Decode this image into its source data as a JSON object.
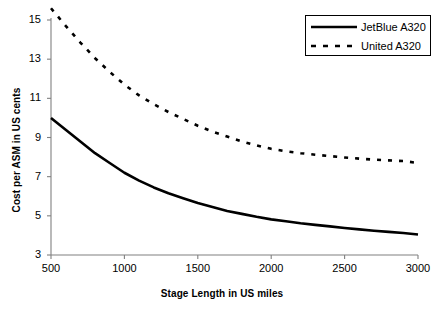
{
  "chart_data": {
    "type": "line",
    "title": "",
    "xlabel": "Stage Length in US miles",
    "ylabel": "Cost per ASM in US cents",
    "xlim": [
      500,
      3000
    ],
    "ylim": [
      3,
      15
    ],
    "xticks": [
      "500",
      "1000",
      "1500",
      "2000",
      "2500",
      "3000"
    ],
    "xtick_values": [
      500,
      1000,
      1500,
      2000,
      2500,
      3000
    ],
    "yticks": [
      "3",
      "5",
      "7",
      "9",
      "11",
      "13",
      "15"
    ],
    "ytick_values": [
      3,
      5,
      7,
      9,
      11,
      13,
      15
    ],
    "grid": false,
    "legend_position": "top-right",
    "x": [
      500,
      600,
      700,
      800,
      900,
      1000,
      1100,
      1200,
      1300,
      1400,
      1500,
      1600,
      1700,
      1800,
      1900,
      2000,
      2100,
      2200,
      2300,
      2400,
      2500,
      2600,
      2700,
      2800,
      2900,
      3000
    ],
    "series": [
      {
        "name": "JetBlue A320",
        "style": "solid",
        "color": "#000000",
        "values": [
          10.0,
          9.4,
          8.8,
          8.2,
          7.7,
          7.2,
          6.8,
          6.45,
          6.15,
          5.9,
          5.65,
          5.45,
          5.25,
          5.1,
          4.95,
          4.82,
          4.72,
          4.62,
          4.54,
          4.46,
          4.38,
          4.31,
          4.24,
          4.18,
          4.12,
          4.05
        ]
      },
      {
        "name": "United A320",
        "style": "dashed",
        "color": "#000000",
        "values": [
          15.6,
          14.7,
          13.85,
          13.05,
          12.35,
          11.7,
          11.15,
          10.7,
          10.3,
          9.95,
          9.6,
          9.3,
          9.05,
          8.8,
          8.6,
          8.42,
          8.3,
          8.2,
          8.12,
          8.05,
          7.98,
          7.92,
          7.87,
          7.83,
          7.8,
          7.7
        ]
      }
    ]
  },
  "axis": {
    "x_title": "Stage Length in US miles",
    "y_title": "Cost per ASM in US cents"
  },
  "legend": {
    "items": [
      {
        "label": "JetBlue A320"
      },
      {
        "label": "United A320"
      }
    ]
  },
  "ticks": {
    "y": [
      "15",
      "13",
      "11",
      "9",
      "7",
      "5",
      "3"
    ],
    "x": [
      "500",
      "1000",
      "1500",
      "2000",
      "2500",
      "3000"
    ]
  },
  "colors": {
    "axis": "#808080",
    "series": "#000000",
    "background": "#ffffff"
  }
}
